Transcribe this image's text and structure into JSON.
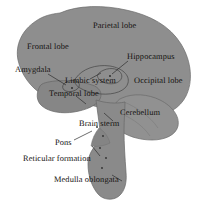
{
  "diagram": {
    "type": "labeled-anatomical-illustration",
    "palette": {
      "background": "#ffffff",
      "cerebrum_fill": "#8e8e8e",
      "cerebellum_fill": "#919191",
      "brainstem_fill": "#8a8a8a",
      "temporal_fill": "#828282",
      "outline": "#5f5f5f",
      "text": "#14110f",
      "leader_line": "#3a3a3a"
    },
    "labels": [
      {
        "id": "parietal-lobe",
        "text": "Parietal lobe",
        "x": 93,
        "y": 27,
        "has_leader": false
      },
      {
        "id": "frontal-lobe",
        "text": "Frontal lobe",
        "x": 27,
        "y": 47,
        "has_leader": false
      },
      {
        "id": "hippocampus",
        "text": "Hippocampus",
        "x": 129,
        "y": 57,
        "has_leader": true
      },
      {
        "id": "amygdala",
        "text": "Amygdala",
        "x": 21,
        "y": 70,
        "has_leader": true
      },
      {
        "id": "limbic-system",
        "text": "Limbic system",
        "x": 66,
        "y": 81,
        "has_leader": true
      },
      {
        "id": "occipital-lobe",
        "text": "Occipital lobe",
        "x": 136,
        "y": 80,
        "has_leader": false
      },
      {
        "id": "temporal-lobe",
        "text": "Temporal lobe",
        "x": 50,
        "y": 94,
        "has_leader": true
      },
      {
        "id": "cerebellum",
        "text": "Cerebellum",
        "x": 122,
        "y": 112,
        "has_leader": false
      },
      {
        "id": "brain-sterm",
        "text": "Brain sterm",
        "x": 80,
        "y": 123,
        "has_leader": true
      },
      {
        "id": "pons",
        "text": "Pons",
        "x": 56,
        "y": 143,
        "has_leader": true
      },
      {
        "id": "reticular-formation",
        "text": "Reticular formation",
        "x": 24,
        "y": 159,
        "has_leader": true
      },
      {
        "id": "medulla-oblongata",
        "text": "Medulla oblongata",
        "x": 55,
        "y": 180,
        "has_leader": true
      }
    ]
  }
}
